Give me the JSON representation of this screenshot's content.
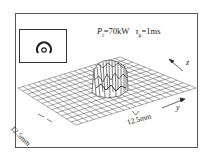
{
  "figure": {
    "parameters": {
      "power_symbol": "P",
      "power_subscript": "t",
      "power_value": "=70kW",
      "pulse_symbol": "τ",
      "pulse_subscript": "μ",
      "pulse_value": "=1ms"
    },
    "axes": {
      "z_label": "z",
      "y_label": "y"
    },
    "scale_bars": {
      "left": "12.5mm",
      "bottom": "12.5mm"
    },
    "inset": {
      "description": "beam cross-section spot"
    },
    "colors": {
      "line": "#333333",
      "background": "#ffffff"
    }
  }
}
